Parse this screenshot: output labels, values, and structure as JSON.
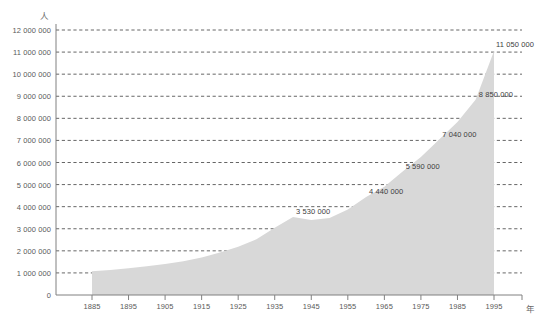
{
  "chart_data": {
    "type": "area",
    "title": "",
    "xlabel": "年",
    "ylabel": "人",
    "xlim": [
      1885,
      1995
    ],
    "ylim": [
      0,
      12000000
    ],
    "grid": true,
    "legend": null,
    "ytick_labels": [
      "12 000 000",
      "11 000 000",
      "10 000 000",
      "9 000 000",
      "8 000 000",
      "7 000 000",
      "6 000 000",
      "5 000 000",
      "4 000 000",
      "3 000 000",
      "2 000 000",
      "1 000 000",
      "0"
    ],
    "ytick_values": [
      12000000,
      11000000,
      10000000,
      9000000,
      8000000,
      7000000,
      6000000,
      5000000,
      4000000,
      3000000,
      2000000,
      1000000,
      0
    ],
    "xtick_labels": [
      "1885",
      "1895",
      "1905",
      "1915",
      "1925",
      "1935",
      "1945",
      "1955",
      "1965",
      "1975",
      "1985",
      "1995"
    ],
    "xtick_values": [
      1885,
      1895,
      1905,
      1915,
      1925,
      1935,
      1945,
      1955,
      1965,
      1975,
      1985,
      1995
    ],
    "x": [
      1885,
      1890,
      1895,
      1900,
      1905,
      1910,
      1915,
      1920,
      1925,
      1930,
      1935,
      1940,
      1945,
      1950,
      1955,
      1960,
      1965,
      1970,
      1975,
      1980,
      1985,
      1990,
      1995
    ],
    "values": [
      1080000,
      1130000,
      1210000,
      1300000,
      1400000,
      1530000,
      1700000,
      1920000,
      2180000,
      2520000,
      3050000,
      3530000,
      3400000,
      3490000,
      3870000,
      4440000,
      4900000,
      5590000,
      6250000,
      7040000,
      7830000,
      8850000,
      11050000
    ],
    "point_labels": [
      {
        "x": 1940,
        "value": 3530000,
        "text": "3 530 000"
      },
      {
        "x": 1960,
        "value": 4440000,
        "text": "4 440 000"
      },
      {
        "x": 1970,
        "value": 5590000,
        "text": "5 590 000"
      },
      {
        "x": 1980,
        "value": 7040000,
        "text": "7 040 000"
      },
      {
        "x": 1990,
        "value": 8850000,
        "text": "8 850 000"
      },
      {
        "x": 1995,
        "value": 11050000,
        "text": "11 050 000"
      }
    ],
    "colors": {
      "area_fill": "#d8d8d8",
      "gridline": "#555555",
      "axis": "#808080",
      "text": "#4a4a4a"
    }
  }
}
